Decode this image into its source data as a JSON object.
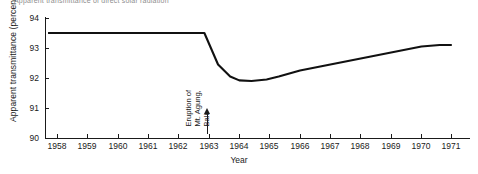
{
  "title_sliver": "Apparent transmittance of direct solar radiation",
  "axis": {
    "ylabel": "Apparent transmittance (percent)",
    "xlabel": "Year"
  },
  "annotation": {
    "line1": "Eruption of",
    "line2": "Mt. Agung,",
    "line3": "Bali"
  },
  "colors": {
    "axis": "#1a1a1a",
    "line": "#111111",
    "background": "#ffffff"
  },
  "chart_data": {
    "type": "line",
    "title": "Apparent transmittance of direct solar radiation",
    "xlabel": "Year",
    "ylabel": "Apparent transmittance (percent)",
    "xlim": [
      1957.6,
      1971.6
    ],
    "ylim": [
      90,
      94
    ],
    "yticks": [
      90,
      91,
      92,
      93,
      94
    ],
    "xticks": [
      1958,
      1959,
      1960,
      1961,
      1962,
      1963,
      1964,
      1965,
      1966,
      1967,
      1968,
      1969,
      1970,
      1971
    ],
    "grid": false,
    "legend": null,
    "annotations": [
      {
        "text": "Eruption of Mt. Agung, Bali",
        "x": 1962.8,
        "y": 90.0,
        "marker": "up-arrow"
      }
    ],
    "series": [
      {
        "name": "Apparent transmittance",
        "x": [
          1957.7,
          1962.85,
          1963.3,
          1963.7,
          1964.0,
          1964.4,
          1964.9,
          1965.3,
          1966.0,
          1967.0,
          1968.0,
          1969.0,
          1970.0,
          1970.6,
          1971.0
        ],
        "values": [
          93.5,
          93.5,
          92.45,
          92.05,
          91.92,
          91.9,
          91.95,
          92.05,
          92.25,
          92.45,
          92.65,
          92.85,
          93.05,
          93.1,
          93.1
        ]
      }
    ]
  }
}
